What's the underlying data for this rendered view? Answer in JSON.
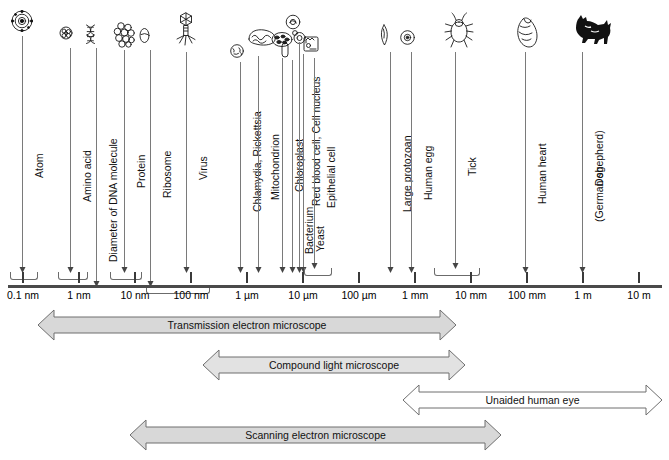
{
  "figure": {
    "axis": {
      "ticks": [
        {
          "label": "0.1 nm",
          "x": 22
        },
        {
          "label": "1 nm",
          "x": 78
        },
        {
          "label": "10 nm",
          "x": 134
        },
        {
          "label": "100 nm",
          "x": 190
        },
        {
          "label": "1 µm",
          "x": 246
        },
        {
          "label": "10 µm",
          "x": 302
        },
        {
          "label": "100 µm",
          "x": 358
        },
        {
          "label": "1 mm",
          "x": 414
        },
        {
          "label": "10 mm",
          "x": 470
        },
        {
          "label": "100 mm",
          "x": 526
        },
        {
          "label": "1 m",
          "x": 582
        },
        {
          "label": "10 m",
          "x": 638
        }
      ]
    },
    "specimens": [
      {
        "name": "Atom",
        "icon": "atom-icon",
        "icon_x": 22,
        "icon_y": 10,
        "line_x": 22,
        "line_top": 36,
        "line_bottom": 268,
        "label_y": 178,
        "span": [
          10,
          36
        ]
      },
      {
        "name": "Amino acid",
        "icon": "amino-acid-icon",
        "icon_x": 70,
        "icon_y": 26,
        "line_x": 70,
        "line_top": 48,
        "line_bottom": 268,
        "label_y": 202,
        "span": [
          58,
          86
        ]
      },
      {
        "name": "Diameter of DNA molecule",
        "icon": "dna-icon",
        "icon_x": 96,
        "icon_y": 24,
        "line_x": 96,
        "line_top": 48,
        "line_bottom": 282,
        "label_y": 262,
        "span": null
      },
      {
        "name": "Protein",
        "icon": "protein-icon",
        "icon_x": 124,
        "icon_y": 22,
        "line_x": 124,
        "line_top": 50,
        "line_bottom": 268,
        "label_y": 188,
        "span": [
          110,
          140
        ]
      },
      {
        "name": "Ribosome",
        "icon": "ribosome-icon",
        "icon_x": 150,
        "icon_y": 28,
        "line_x": 150,
        "line_top": 50,
        "line_bottom": 282,
        "label_y": 198,
        "span": [
          146,
          208
        ]
      },
      {
        "name": "Virus",
        "icon": "virus-icon",
        "icon_x": 186,
        "icon_y": 12,
        "line_x": 186,
        "line_top": 52,
        "line_bottom": 268,
        "label_y": 180,
        "span": null
      },
      {
        "name": "Chlamydia, Rickettsia",
        "icon": "chlamydia-icon",
        "icon_x": 240,
        "icon_y": 44,
        "line_x": 240,
        "line_top": 62,
        "line_bottom": 268,
        "label_y": 212,
        "span": null
      },
      {
        "name": "Mitochondrion",
        "icon": "mitochondrion-icon",
        "icon_x": 258,
        "icon_y": 28,
        "line_x": 258,
        "line_top": 56,
        "line_bottom": 268,
        "label_y": 200,
        "span": null
      },
      {
        "name": "Chloroplast",
        "icon": "chloroplast-icon",
        "icon_x": 282,
        "icon_y": 32,
        "line_x": 282,
        "line_top": 58,
        "line_bottom": 268,
        "label_y": 192,
        "span": null
      },
      {
        "name": "Bacterium",
        "icon": "bacterium-icon",
        "icon_x": 292,
        "icon_y": 42,
        "line_x": 292,
        "line_top": 60,
        "line_bottom": 268,
        "label_y": 254,
        "span": null
      },
      {
        "name": "Red blood cell, Cell nucleus",
        "icon": "rbc-icon",
        "icon_x": 296,
        "icon_y": 14,
        "line_x": 299,
        "line_top": 42,
        "line_bottom": 268,
        "label_y": 206,
        "span": null
      },
      {
        "name": "Yeast",
        "icon": "yeast-icon",
        "icon_x": 303,
        "icon_y": 30,
        "line_x": 303,
        "line_top": 54,
        "line_bottom": 268,
        "label_y": 252,
        "span": null
      },
      {
        "name": "Epithelial cell",
        "icon": "epithelial-icon",
        "icon_x": 314,
        "icon_y": 36,
        "line_x": 314,
        "line_top": 58,
        "line_bottom": 264,
        "label_y": 208,
        "span": [
          304,
          330
        ]
      },
      {
        "name": "Large protozoan",
        "icon": "protozoan-icon",
        "icon_x": 390,
        "icon_y": 24,
        "line_x": 390,
        "line_top": 52,
        "line_bottom": 268,
        "label_y": 212,
        "span": null
      },
      {
        "name": "Human egg",
        "icon": "human-egg-icon",
        "icon_x": 411,
        "icon_y": 30,
        "line_x": 411,
        "line_top": 52,
        "line_bottom": 268,
        "label_y": 200,
        "span": null
      },
      {
        "name": "Tick",
        "icon": "tick-icon",
        "icon_x": 455,
        "icon_y": 12,
        "line_x": 455,
        "line_top": 52,
        "line_bottom": 264,
        "label_y": 176,
        "span": [
          434,
          478
        ]
      },
      {
        "name": "Human heart",
        "icon": "heart-icon",
        "icon_x": 525,
        "icon_y": 16,
        "line_x": 525,
        "line_top": 52,
        "line_bottom": 268,
        "label_y": 204,
        "span": null
      },
      {
        "name": "Dog",
        "icon": "dog-icon",
        "icon_x": 582,
        "icon_y": 14,
        "line_x": 582,
        "line_top": 52,
        "line_bottom": 268,
        "label_y": 186,
        "span": null
      },
      {
        "name": "(German shepherd)",
        "icon": null,
        "icon_x": 0,
        "icon_y": 0,
        "line_x": 0,
        "line_top": 0,
        "line_bottom": 0,
        "label_y": 222,
        "span": null
      }
    ],
    "ranges": [
      {
        "label": "Transmission electron microscope",
        "x": 38,
        "width": 418,
        "y": 310,
        "fill": "#d8d8d8"
      },
      {
        "label": "Compound light microscope",
        "x": 203,
        "width": 262,
        "y": 350,
        "fill": "#e2e2e2"
      },
      {
        "label": "Unaided human eye",
        "x": 403,
        "width": 259,
        "y": 385,
        "fill": "#ffffff"
      },
      {
        "label": "Scanning electron microscope",
        "x": 130,
        "width": 371,
        "y": 420,
        "fill": "#d8d8d8"
      }
    ]
  }
}
